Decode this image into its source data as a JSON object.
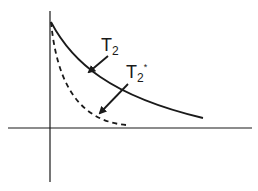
{
  "diagram": {
    "title": "",
    "colors": {
      "ink": "#1a1a1a",
      "background": "#ffffff"
    },
    "axes": {
      "horizontal": {
        "x1": 8,
        "x2": 252,
        "y": 128
      },
      "vertical": {
        "x": 50,
        "y1": 11,
        "y2": 182
      }
    },
    "curves": [
      {
        "name": "T2",
        "style": "solid",
        "path": "M 51 22 C 72 62, 110 96, 203 118"
      },
      {
        "name": "T2*",
        "style": "dashed",
        "path": "M 51 22 C 56 72, 72 120, 126 125"
      }
    ],
    "labels": [
      {
        "id": "t2",
        "main": "T",
        "sub": "2",
        "sup": "",
        "x": 101,
        "y": 51
      },
      {
        "id": "t2star",
        "main": "T",
        "sub": "2",
        "sup": "*",
        "x": 126,
        "y": 78
      }
    ],
    "arrows": [
      {
        "target": "T2",
        "x1": 108,
        "y1": 56,
        "x2": 89,
        "y2": 72
      },
      {
        "target": "T2*",
        "x1": 128,
        "y1": 84,
        "x2": 100,
        "y2": 113
      }
    ]
  }
}
